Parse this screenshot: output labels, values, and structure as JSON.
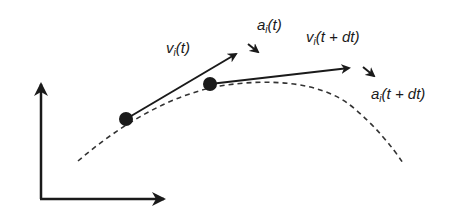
{
  "diagram": {
    "colors": {
      "stroke": "#1a1a1a",
      "background": "#ffffff"
    },
    "axes": {
      "vertical": "y-axis-arrow",
      "horizontal": "x-axis-arrow"
    },
    "points": [
      {
        "id": "particle-at-t",
        "x": 126,
        "y": 119
      },
      {
        "id": "particle-at-t-plus-dt",
        "x": 210,
        "y": 84
      }
    ],
    "labels": {
      "v_t": {
        "base": "v",
        "sub": "i",
        "arg": "(t)"
      },
      "a_t": {
        "base": "a",
        "sub": "i",
        "arg": "(t)"
      },
      "v_tdt": {
        "base": "v",
        "sub": "i",
        "arg": "(t + dt)"
      },
      "a_tdt": {
        "base": "a",
        "sub": "i",
        "arg": "(t + dt)"
      }
    }
  }
}
